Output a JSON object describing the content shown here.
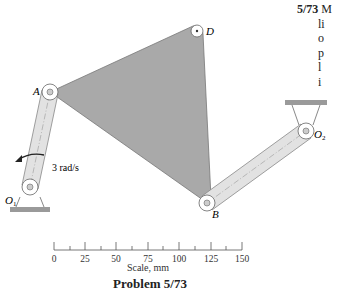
{
  "problem": {
    "number": "5/73",
    "text_fragments": [
      "M",
      "li",
      "o",
      "p",
      "l",
      "i"
    ],
    "caption": "Problem 5/73"
  },
  "labels": {
    "A": "A",
    "B": "B",
    "D": "D",
    "O1": "O",
    "O1_sub": "1",
    "O2": "O",
    "O2_sub": "2",
    "angular_velocity": "3 rad/s"
  },
  "scale": {
    "label": "Scale, mm",
    "ticks": [
      "0",
      "25",
      "50",
      "75",
      "100",
      "125",
      "150"
    ]
  },
  "colors": {
    "plate": "#a9a9a9",
    "link": "#e2e2e2",
    "ground": "#9a9a9a",
    "ink": "#333333"
  }
}
